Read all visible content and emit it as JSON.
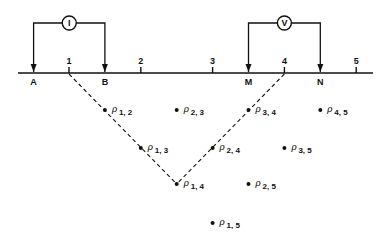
{
  "diagram": {
    "stations": [
      {
        "id": "1",
        "label": "1"
      },
      {
        "id": "2",
        "label": "2"
      },
      {
        "id": "3",
        "label": "3"
      },
      {
        "id": "4",
        "label": "4"
      },
      {
        "id": "5",
        "label": "5"
      }
    ],
    "electrodes": [
      {
        "id": "A",
        "label": "A",
        "station": 0.5
      },
      {
        "id": "B",
        "label": "B",
        "station": 1.5
      },
      {
        "id": "M",
        "label": "M",
        "station": 3.5
      },
      {
        "id": "N",
        "label": "N",
        "station": 4.5
      }
    ],
    "meters": [
      {
        "id": "current",
        "symbol": "I",
        "between": [
          "A",
          "B"
        ]
      },
      {
        "id": "voltage",
        "symbol": "V",
        "between": [
          "M",
          "N"
        ]
      }
    ],
    "rho_symbol": "ρ",
    "points": [
      {
        "i": 1,
        "j": 2,
        "sub": "1, 2"
      },
      {
        "i": 2,
        "j": 3,
        "sub": "2, 3"
      },
      {
        "i": 3,
        "j": 4,
        "sub": "3, 4"
      },
      {
        "i": 4,
        "j": 5,
        "sub": "4, 5"
      },
      {
        "i": 1,
        "j": 3,
        "sub": "1, 3"
      },
      {
        "i": 2,
        "j": 4,
        "sub": "2, 4"
      },
      {
        "i": 3,
        "j": 5,
        "sub": "3, 5"
      },
      {
        "i": 1,
        "j": 4,
        "sub": "1, 4"
      },
      {
        "i": 2,
        "j": 5,
        "sub": "2, 5"
      },
      {
        "i": 1,
        "j": 5,
        "sub": "1, 5"
      }
    ],
    "construction_lines": [
      {
        "from_station": 1,
        "to_point": "1, 4"
      },
      {
        "from_station": 4,
        "to_point": "1, 4"
      }
    ]
  }
}
